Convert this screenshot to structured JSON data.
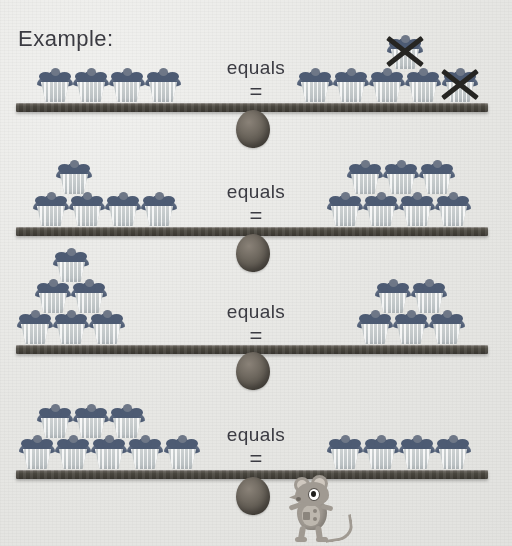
{
  "page": {
    "title_label": "Example:",
    "background_color": "#e9e9e7",
    "ink_color": "#3b3b42",
    "beam_color": "#4c4941",
    "frosting_color": "#4d5b73",
    "wrapper_color": "#d4d8d8",
    "cross_color": "#262522",
    "mouse_color": "#a09a92"
  },
  "equals": {
    "word": "equals",
    "symbol": "="
  },
  "icons": {
    "cupcake": "cupcake-icon",
    "cross_out": "cross-out-icon",
    "fulcrum": "fulcrum-icon",
    "beam": "balance-beam-icon",
    "mouse": "mouse-mascot-icon"
  },
  "rows": [
    {
      "id": "row-1",
      "is_example": true,
      "label": "Example:",
      "left": {
        "bottom_count": 4,
        "top_count": 0,
        "total": 4,
        "crossed_out": 0
      },
      "right": {
        "bottom_count": 5,
        "top_count": 1,
        "total": 6,
        "crossed_out": 2,
        "crossed_positions": [
          "top-1",
          "bottom-5"
        ]
      }
    },
    {
      "id": "row-2",
      "is_example": false,
      "left": {
        "bottom_count": 4,
        "top_count": 1,
        "total": 5,
        "crossed_out": 0
      },
      "right": {
        "bottom_count": 4,
        "top_count": 3,
        "total": 7,
        "crossed_out": 0
      }
    },
    {
      "id": "row-3",
      "is_example": false,
      "left": {
        "bottom_count": 3,
        "middle_count": 2,
        "top_count": 1,
        "total": 6,
        "crossed_out": 0
      },
      "right": {
        "bottom_count": 3,
        "top_count": 2,
        "total": 5,
        "crossed_out": 0
      }
    },
    {
      "id": "row-4",
      "is_example": false,
      "left": {
        "bottom_count": 5,
        "top_count": 3,
        "total": 8,
        "crossed_out": 0
      },
      "right": {
        "bottom_count": 4,
        "top_count": 0,
        "total": 4,
        "crossed_out": 0
      }
    }
  ]
}
